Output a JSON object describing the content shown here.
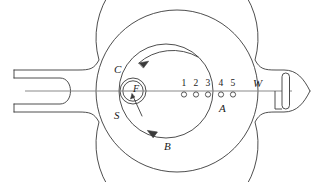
{
  "figure": {
    "stroke_color": "#3a3a3a",
    "axis_color": "#7a7a7a",
    "background": "#ffffff"
  },
  "labels": {
    "filament": "F",
    "upper_left": "C",
    "lower_left": "S",
    "bottom_arrow": "B",
    "port_group": "A",
    "window": "W"
  },
  "ports": {
    "numbers": [
      "1",
      "2",
      "3",
      "4",
      "5"
    ],
    "group_label": "A",
    "marker_shape": "small-circle"
  },
  "arrows": {
    "top": {
      "direction": "counterclockwise",
      "points": "left"
    },
    "bottom": {
      "direction": "counterclockwise",
      "points": "right"
    },
    "filament_pointer": {
      "direction": "up-left",
      "points": "to-filament"
    }
  },
  "geometry": {
    "outer_bulb_center_x": 177,
    "outer_bulb_center_y": 91,
    "outer_bulb_radius": 81,
    "inner_circle_center_x": 166,
    "inner_circle_center_y": 91,
    "inner_circle_radius": 47,
    "filament_ring_x": 133,
    "filament_ring_y": 91,
    "filament_ring_outer_radius": 13,
    "filament_ring_inner_radius": 10,
    "axis_y": 91,
    "port_circle_radius": 2.6,
    "port_x_positions": [
      184,
      196,
      208,
      221,
      233
    ]
  }
}
